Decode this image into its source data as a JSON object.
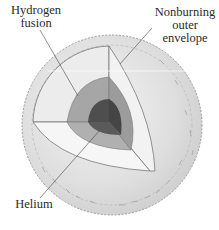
{
  "diagram": {
    "labels": {
      "hydrogen_fusion": [
        "Hydrogen",
        "fusion"
      ],
      "nonburning_envelope": [
        "Nonburning",
        "outer",
        "envelope"
      ],
      "helium": [
        "Helium"
      ]
    },
    "layers": [
      {
        "name": "Helium core",
        "color": "#4a4a4a"
      },
      {
        "name": "Hydrogen fusion shell",
        "color": "#9a9a9a"
      },
      {
        "name": "Nonburning outer envelope (cutaway)",
        "color": "#ebebeb"
      },
      {
        "name": "Outer surface",
        "color": "#d8d8d8"
      }
    ]
  }
}
